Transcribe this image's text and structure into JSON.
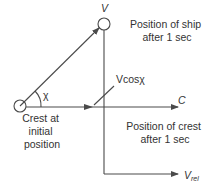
{
  "diagram": {
    "type": "vector-velocity-diagram",
    "colors": {
      "line": "#4a4a4a",
      "text": "#333333",
      "background": "#ffffff"
    },
    "labels": {
      "ship_velocity": "V",
      "wave_celerity": "C",
      "relative_velocity_main": "V",
      "relative_velocity_sub": "rel",
      "component": "Vcosχ",
      "angle": "χ",
      "crest_initial": [
        "Crest at",
        "initial",
        "position"
      ],
      "ship_after": [
        "Position of ship",
        "after 1 sec"
      ],
      "crest_after": [
        "Position of crest",
        "after 1 sec"
      ]
    },
    "nodes": [
      {
        "id": "crest-initial",
        "shape": "circle",
        "cx": 20,
        "cy": 106
      },
      {
        "id": "ship-after",
        "shape": "circle",
        "cx": 104,
        "cy": 24
      }
    ],
    "edges": [
      {
        "id": "ship-velocity-vector",
        "from": "crest-initial",
        "to": "ship-after",
        "label": "V"
      },
      {
        "id": "celerity-vector",
        "from": "crest-initial",
        "to": "C",
        "label": "C"
      },
      {
        "id": "vertical-drop",
        "from": "ship-after",
        "to": "vrel-corner"
      },
      {
        "id": "relative-velocity-vector",
        "from": "vrel-corner",
        "to": "Vrel",
        "label": "Vrel"
      }
    ]
  }
}
